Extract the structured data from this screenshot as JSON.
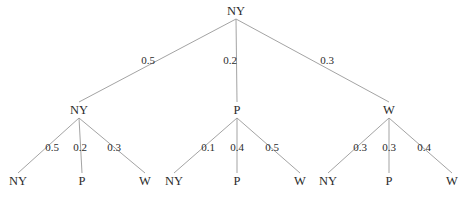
{
  "diagram": {
    "type": "probability-tree",
    "background_color": "#ffffff",
    "edge_color": "#999999",
    "text_color": "#2b2b2b",
    "width": 469,
    "height": 199
  },
  "chart_data": {
    "type": "tree",
    "title": "",
    "states": [
      "NY",
      "P",
      "W"
    ],
    "root": {
      "label": "NY",
      "x": 236,
      "y": 11
    },
    "level1": [
      {
        "label": "NY",
        "x": 79,
        "y": 110,
        "prob": "0.5",
        "prob_x": 148,
        "prob_y": 60
      },
      {
        "label": "P",
        "x": 237,
        "y": 110,
        "prob": "0.2",
        "prob_x": 230,
        "prob_y": 60
      },
      {
        "label": "W",
        "x": 389,
        "y": 110,
        "prob": "0.3",
        "prob_x": 327,
        "prob_y": 60
      }
    ],
    "level2": [
      {
        "parent": "NY",
        "leaves": [
          {
            "label": "NY",
            "x": 18,
            "y": 181,
            "prob": "0.5",
            "prob_x": 52,
            "prob_y": 147
          },
          {
            "label": "P",
            "x": 82,
            "y": 181,
            "prob": "0.2",
            "prob_x": 80,
            "prob_y": 147
          },
          {
            "label": "W",
            "x": 145,
            "y": 181,
            "prob": "0.3",
            "prob_x": 114,
            "prob_y": 147
          }
        ]
      },
      {
        "parent": "P",
        "leaves": [
          {
            "label": "NY",
            "x": 174,
            "y": 181,
            "prob": "0.1",
            "prob_x": 208,
            "prob_y": 147
          },
          {
            "label": "P",
            "x": 237,
            "y": 181,
            "prob": "0.4",
            "prob_x": 237,
            "prob_y": 147
          },
          {
            "label": "W",
            "x": 300,
            "y": 181,
            "prob": "0.5",
            "prob_x": 272,
            "prob_y": 147
          }
        ]
      },
      {
        "parent": "W",
        "leaves": [
          {
            "label": "NY",
            "x": 328,
            "y": 181,
            "prob": "0.3",
            "prob_x": 360,
            "prob_y": 147
          },
          {
            "label": "P",
            "x": 389,
            "y": 181,
            "prob": "0.3",
            "prob_x": 389,
            "prob_y": 147
          },
          {
            "label": "W",
            "x": 452,
            "y": 181,
            "prob": "0.4",
            "prob_x": 424,
            "prob_y": 147
          }
        ]
      }
    ]
  }
}
